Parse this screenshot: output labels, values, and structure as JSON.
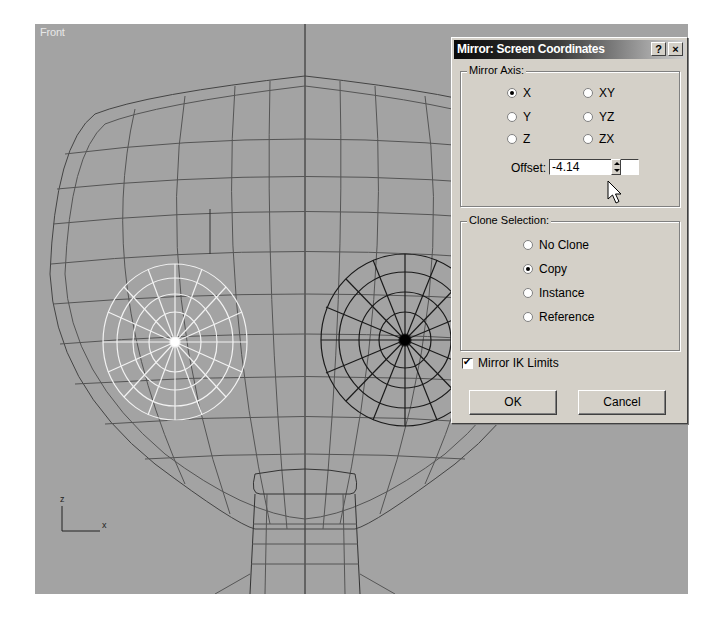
{
  "viewport": {
    "label": "Front",
    "axis_labels": {
      "z": "z",
      "x": "x",
      "y": "y"
    },
    "background": "#a3a3a3"
  },
  "dialog": {
    "title": "Mirror: Screen Coordinates",
    "help_button": "?",
    "close_button": "×",
    "mirror_axis": {
      "label": "Mirror Axis:",
      "options": [
        {
          "label": "X",
          "selected": true
        },
        {
          "label": "Y",
          "selected": false
        },
        {
          "label": "Z",
          "selected": false
        },
        {
          "label": "XY",
          "selected": false
        },
        {
          "label": "YZ",
          "selected": false
        },
        {
          "label": "ZX",
          "selected": false
        }
      ],
      "offset_label": "Offset:",
      "offset_value": "-4.14"
    },
    "clone_selection": {
      "label": "Clone Selection:",
      "options": [
        {
          "label": "No Clone",
          "selected": false
        },
        {
          "label": "Copy",
          "selected": true
        },
        {
          "label": "Instance",
          "selected": false
        },
        {
          "label": "Reference",
          "selected": false
        }
      ]
    },
    "mirror_ik_limits": {
      "label": "Mirror IK Limits",
      "checked": true
    },
    "ok_label": "OK",
    "cancel_label": "Cancel"
  }
}
